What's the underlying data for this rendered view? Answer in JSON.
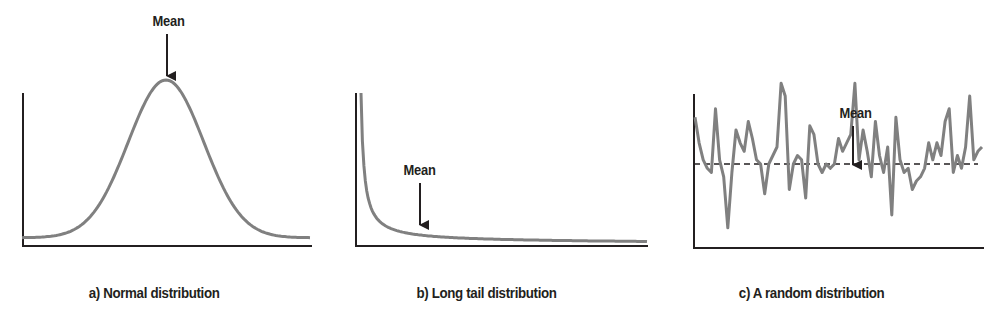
{
  "figure": {
    "colors": {
      "axis": "#231f20",
      "curve": "#808080",
      "arrow": "#231f20",
      "mean_line": "#231f20",
      "background": "#ffffff"
    }
  },
  "chart_data": [
    {
      "type": "line",
      "id": "a",
      "title": "a) Normal distribution",
      "xlabel": "",
      "ylabel": "",
      "grid": false,
      "annotations": [
        {
          "text": "Mean",
          "points_to": "peak of curve (center)",
          "arrow": "down"
        }
      ],
      "x": [
        -4,
        -3.5,
        -3,
        -2.5,
        -2,
        -1.5,
        -1,
        -0.5,
        0,
        0.5,
        1,
        1.5,
        2,
        2.5,
        3,
        3.5,
        4
      ],
      "values": [
        0.02,
        0.04,
        0.08,
        0.15,
        0.26,
        0.42,
        0.62,
        0.85,
        1.0,
        0.85,
        0.62,
        0.42,
        0.26,
        0.15,
        0.08,
        0.04,
        0.02
      ],
      "description": "Symmetric bell-shaped curve, peak at center"
    },
    {
      "type": "line",
      "id": "b",
      "title": "b) Long tail distribution",
      "xlabel": "",
      "ylabel": "",
      "grid": false,
      "annotations": [
        {
          "text": "Mean",
          "points_to": "curve at ~20% of x range",
          "arrow": "down"
        }
      ],
      "x": [
        0.02,
        0.05,
        0.1,
        0.15,
        0.2,
        0.3,
        0.4,
        0.5,
        0.6,
        0.7,
        0.8,
        0.9,
        1.0
      ],
      "values": [
        1.0,
        0.55,
        0.3,
        0.2,
        0.14,
        0.09,
        0.06,
        0.045,
        0.035,
        0.028,
        0.024,
        0.022,
        0.02
      ],
      "description": "Rapidly decaying curve with long flat tail"
    },
    {
      "type": "line",
      "id": "c",
      "title": "c) A random distribution",
      "xlabel": "",
      "ylabel": "",
      "grid": false,
      "annotations": [
        {
          "text": "Mean",
          "points_to": "dashed horizontal mean line",
          "arrow": "down"
        }
      ],
      "mean_line": {
        "style": "dashed",
        "value": 0
      },
      "x": [
        0,
        1,
        2,
        3,
        4,
        5,
        6,
        7,
        8,
        9,
        10,
        11,
        12,
        13,
        14,
        15,
        16,
        17,
        18,
        19,
        20,
        21,
        22,
        23,
        24,
        25,
        26,
        27,
        28,
        29,
        30,
        31,
        32,
        33,
        34,
        35,
        36,
        37,
        38,
        39,
        40,
        41,
        42,
        43,
        44,
        45,
        46,
        47,
        48,
        49,
        50,
        51,
        52,
        53,
        54,
        55,
        56,
        57,
        58,
        59,
        60,
        61,
        62,
        63,
        64,
        65,
        66,
        67,
        68,
        69,
        70
      ],
      "values": [
        0.55,
        0.25,
        0.05,
        -0.05,
        -0.1,
        0.65,
        0.05,
        -0.15,
        -0.75,
        -0.1,
        0.4,
        0.25,
        0.15,
        0.5,
        0.3,
        0.05,
        0.0,
        -0.35,
        0.0,
        0.1,
        0.2,
        0.95,
        0.8,
        -0.3,
        0.0,
        0.1,
        0.05,
        -0.4,
        0.45,
        0.35,
        0.0,
        -0.1,
        0.0,
        -0.05,
        0.0,
        0.3,
        0.15,
        0.25,
        0.35,
        0.95,
        0.05,
        0.4,
        0.15,
        -0.15,
        0.5,
        0.1,
        -0.1,
        0.2,
        -0.6,
        0.55,
        0.05,
        -0.1,
        -0.05,
        -0.3,
        -0.2,
        -0.15,
        -0.05,
        0.25,
        0.05,
        0.25,
        0.1,
        0.5,
        0.65,
        -0.1,
        0.1,
        -0.05,
        0.2,
        0.8,
        0.05,
        0.15,
        0.2
      ],
      "description": "Noisy fluctuating series around a dashed mean line"
    }
  ],
  "panels": {
    "a": {
      "caption": "a) Normal distribution",
      "mean_label": "Mean"
    },
    "b": {
      "caption": "b) Long tail distribution",
      "mean_label": "Mean"
    },
    "c": {
      "caption": "c) A random distribution",
      "mean_label": "Mean"
    }
  }
}
